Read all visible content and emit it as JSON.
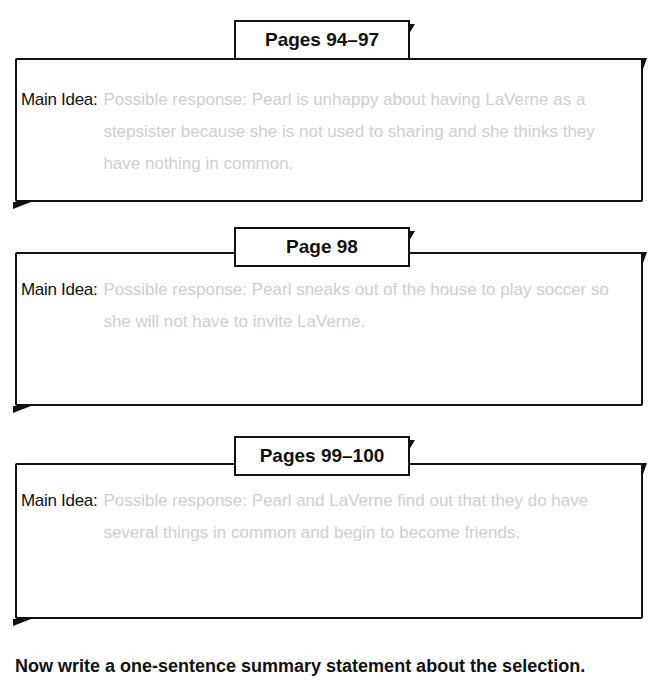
{
  "sections": [
    {
      "tab": "Pages 94–97",
      "label": "Main Idea:",
      "answer": "Possible response: Pearl is unhappy about having LaVerne as a stepsister because she is not used to sharing and she thinks they have nothing in common."
    },
    {
      "tab": "Page 98",
      "label": "Main Idea:",
      "answer": "Possible response: Pearl sneaks out of the house to play soccer so she will not have to invite LaVerne."
    },
    {
      "tab": "Pages 99–100",
      "label": "Main Idea:",
      "answer": "Possible response: Pearl and LaVerne find out that they do have several things in common and begin to become friends."
    }
  ],
  "summary_prompt": "Now write a one-sentence summary statement about the selection."
}
